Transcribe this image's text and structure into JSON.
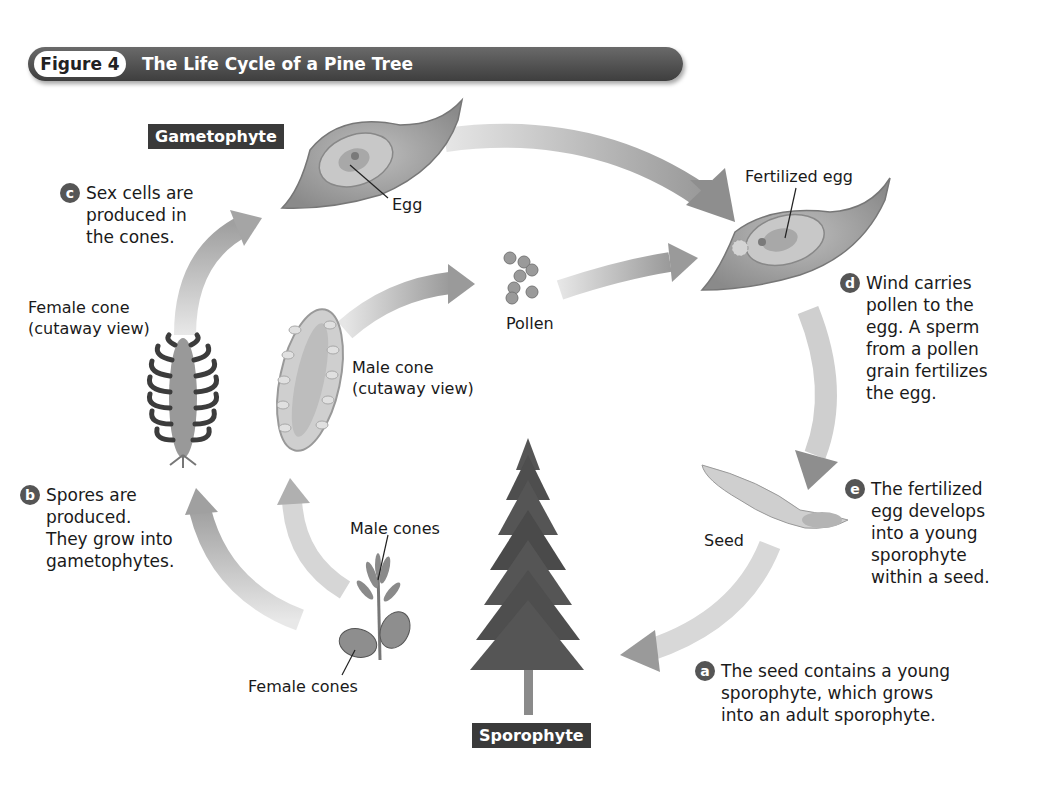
{
  "figure": {
    "number_label": "Figure 4",
    "title": "The Life Cycle of a Pine Tree"
  },
  "stages": {
    "gametophyte": "Gametophyte",
    "sporophyte": "Sporophyte"
  },
  "labels": {
    "egg": "Egg",
    "fertilized_egg": "Fertilized egg",
    "pollen": "Pollen",
    "female_cone": "Female cone\n(cutaway view)",
    "male_cone": "Male cone\n(cutaway view)",
    "male_cones": "Male cones",
    "female_cones": "Female cones",
    "seed": "Seed"
  },
  "steps": [
    {
      "letter": "a",
      "text": "The seed contains a young\nsporophyte, which grows\ninto an adult sporophyte."
    },
    {
      "letter": "b",
      "text": "Spores are\nproduced.\nThey grow into\ngametophytes."
    },
    {
      "letter": "c",
      "text": "Sex cells are\nproduced in\nthe cones."
    },
    {
      "letter": "d",
      "text": "Wind carries\npollen to the\negg. A sperm\nfrom a pollen\ngrain fertilizes\nthe egg."
    },
    {
      "letter": "e",
      "text": "The fertilized\negg develops\ninto a young\nsporophyte\nwithin a seed."
    }
  ]
}
